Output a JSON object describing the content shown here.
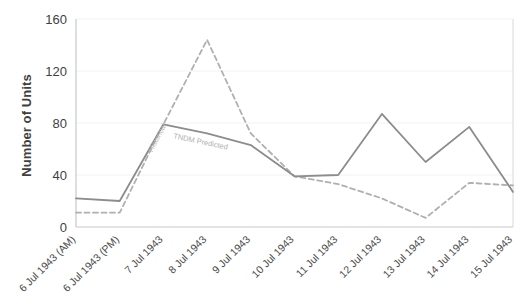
{
  "chart_data": {
    "type": "line",
    "title": "",
    "xlabel": "",
    "ylabel": "Number of Units",
    "ylim": [
      0,
      160
    ],
    "yticks": [
      0,
      40,
      80,
      120,
      160
    ],
    "grid": true,
    "legend": "inline-labels",
    "categories": [
      "6 Jul 1943 (AM)",
      "6 Jul 1943 (PM)",
      "7 Jul 1943",
      "8 Jul 1943",
      "9 Jul 1943",
      "10 Jul 1943",
      "11 Jul 1943",
      "12 Jul 1943",
      "13 Jul 1943",
      "14 Jul 1943",
      "15 Jul 1943"
    ],
    "series": [
      {
        "name": "Historical",
        "style": "dashed",
        "color": "#b0b0b0",
        "label_text": "Historical",
        "values": [
          11,
          11,
          79,
          144,
          72,
          39,
          33,
          22,
          7,
          34,
          32
        ]
      },
      {
        "name": "TNDM Predicted",
        "style": "solid",
        "color": "#8c8c8c",
        "label_text": "TNDM Predicted",
        "values": [
          22,
          20,
          79,
          72,
          63,
          39,
          40,
          87,
          50,
          77,
          27
        ]
      }
    ]
  },
  "axis": {
    "y_title": "Number of Units"
  }
}
